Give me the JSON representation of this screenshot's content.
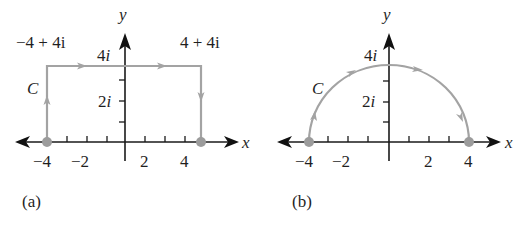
{
  "figure": {
    "panels": [
      {
        "id": "a",
        "caption": "(a)",
        "contour_label": "C",
        "shape": "rectangle",
        "vertices": [
          [
            -4,
            0
          ],
          [
            -4,
            4
          ],
          [
            4,
            4
          ],
          [
            4,
            0
          ]
        ],
        "corner_labels": {
          "top_left": "−4 + 4i",
          "top_right": "4 + 4i"
        },
        "axis_labels": {
          "x": "x",
          "y": "y"
        },
        "x_ticks": [
          "−4",
          "−2",
          "2",
          "4"
        ],
        "y_ticks": [
          "2i",
          "4i"
        ],
        "direction": "clockwise: up from −4, right along Im=4, down to 4"
      },
      {
        "id": "b",
        "caption": "(b)",
        "contour_label": "C",
        "shape": "semicircle",
        "center": [
          0,
          0
        ],
        "radius": 4,
        "axis_labels": {
          "x": "x",
          "y": "y"
        },
        "x_ticks": [
          "−4",
          "−2",
          "2",
          "4"
        ],
        "y_ticks": [
          "2i",
          "4i"
        ],
        "direction": "from −4 over the top to 4"
      }
    ],
    "colors": {
      "axis": "#1a1a1a",
      "contour": "#a3a3a3",
      "endpoint": "#9c9c9c",
      "background": "#ffffff"
    }
  }
}
